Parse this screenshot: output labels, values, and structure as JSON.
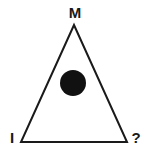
{
  "diagram": {
    "type": "triangle",
    "vertices": {
      "top": {
        "label": "M",
        "x": 74,
        "y": 25
      },
      "bottom_left": {
        "label": "I",
        "x": 21,
        "y": 142
      },
      "bottom_right": {
        "label": "?",
        "x": 127,
        "y": 142
      }
    },
    "center_dot": {
      "x": 73,
      "y": 83,
      "r": 13,
      "color": "#111111"
    },
    "stroke_color": "#1a1a1a",
    "fill_color": "#ffffff"
  }
}
